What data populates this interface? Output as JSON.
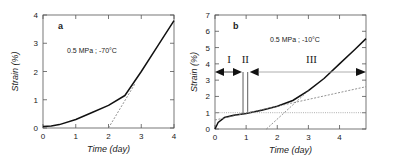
{
  "chart_data": [
    {
      "type": "line",
      "panel_label": "a",
      "annotation": "0.5 MPa  ; -70°C",
      "title": "",
      "xlabel": "Time (day)",
      "ylabel": "Strain (%)",
      "xlim": [
        0,
        4
      ],
      "ylim": [
        0,
        4
      ],
      "xticks": [
        "0",
        "1",
        "2",
        "3",
        "4"
      ],
      "yticks": [
        "0",
        "1",
        "2",
        "3",
        "4"
      ],
      "grid": false,
      "series": [
        {
          "name": "creep curve",
          "style": "solid",
          "x": [
            0,
            0.25,
            0.5,
            1.0,
            1.5,
            2.0,
            2.5,
            3.0,
            3.5,
            4.0
          ],
          "y": [
            0.05,
            0.07,
            0.12,
            0.3,
            0.55,
            0.8,
            1.15,
            2.0,
            2.9,
            3.8
          ]
        },
        {
          "name": "tangent (tertiary extrapolation)",
          "style": "dashed",
          "x": [
            2.0,
            2.8
          ],
          "y": [
            0.0,
            1.55
          ]
        }
      ]
    },
    {
      "type": "line",
      "panel_label": "b",
      "annotation": "0.5 MPa  ; -10°C",
      "title": "",
      "xlabel": "Time (day)",
      "ylabel": "Strain (%)",
      "xlim": [
        0,
        4.85
      ],
      "ylim": [
        0,
        7
      ],
      "xticks": [
        "0",
        "1",
        "2",
        "3",
        "4"
      ],
      "yticks": [
        "0",
        "1",
        "2",
        "3",
        "4",
        "5",
        "6",
        "7"
      ],
      "grid": false,
      "stages": [
        {
          "label": "I",
          "x_start": 0,
          "x_end": 0.9
        },
        {
          "label": "II",
          "x_start": 0.9,
          "x_end": 1.05
        },
        {
          "label": "III",
          "x_start": 1.05,
          "x_end": 4.85
        }
      ],
      "stage_arrow_y": 3.5,
      "series": [
        {
          "name": "creep curve",
          "style": "solid",
          "x": [
            0,
            0.1,
            0.3,
            0.6,
            1.0,
            1.5,
            2.0,
            2.5,
            3.0,
            3.5,
            4.0,
            4.5,
            4.85
          ],
          "y": [
            0,
            0.4,
            0.7,
            0.85,
            0.95,
            1.15,
            1.4,
            1.75,
            2.35,
            3.1,
            4.0,
            4.9,
            5.55
          ]
        },
        {
          "name": "secondary tangent",
          "style": "dashed",
          "x": [
            0,
            4.85
          ],
          "y": [
            0.55,
            2.6
          ]
        },
        {
          "name": "tertiary tangent",
          "style": "dashed",
          "x": [
            1.65,
            3.0
          ],
          "y": [
            0,
            2.35
          ]
        },
        {
          "name": "reference 1%",
          "style": "dotted",
          "x": [
            0,
            4.85
          ],
          "y": [
            1,
            1
          ]
        }
      ]
    }
  ]
}
